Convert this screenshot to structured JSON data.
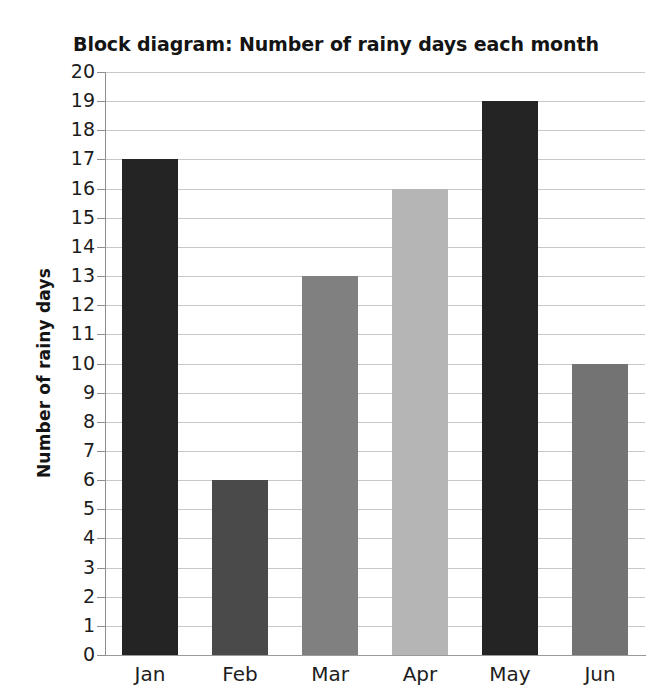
{
  "chart_data": {
    "type": "bar",
    "title": "Block diagram: Number of rainy days each month",
    "xlabel": "",
    "ylabel": "Number of rainy days",
    "categories": [
      "Jan",
      "Feb",
      "Mar",
      "Apr",
      "May",
      "Jun"
    ],
    "values": [
      17,
      6,
      13,
      16,
      19,
      10
    ],
    "ylim": [
      0,
      20
    ],
    "ytick_step": 1,
    "ytick_labels": [
      "20",
      "19",
      "18",
      "17",
      "16",
      "15",
      "14",
      "13",
      "12",
      "11",
      "10",
      "9",
      "8",
      "7",
      "6",
      "5",
      "4",
      "3",
      "2",
      "1",
      "0"
    ],
    "grid": true,
    "legend": false,
    "bar_colors": [
      "#242424",
      "#4a4a4a",
      "#808080",
      "#b5b5b5",
      "#242424",
      "#737373"
    ],
    "bars": [
      {
        "category": "Jan",
        "value": 17,
        "color": "#242424"
      },
      {
        "category": "Feb",
        "value": 6,
        "color": "#4a4a4a"
      },
      {
        "category": "Mar",
        "value": 13,
        "color": "#808080"
      },
      {
        "category": "Apr",
        "value": 16,
        "color": "#b5b5b5"
      },
      {
        "category": "May",
        "value": 19,
        "color": "#242424"
      },
      {
        "category": "Jun",
        "value": 10,
        "color": "#737373"
      }
    ],
    "colors": {
      "background": "#ffffff",
      "gridline": "#c8c8c8",
      "axis": "#8e8e8e",
      "text": "#1d1d1d"
    }
  }
}
